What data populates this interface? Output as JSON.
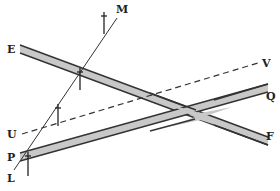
{
  "diagram": {
    "labels": {
      "M": "M",
      "E": "E",
      "V": "V",
      "U": "U",
      "Q": "Q",
      "P": "P",
      "F": "F",
      "L": "L"
    },
    "colors": {
      "band_fill": "#c8c8c8",
      "band_stroke": "#333333",
      "line": "#333333",
      "background": "#ffffff"
    },
    "elements": [
      {
        "type": "band",
        "from": "E",
        "to": "F"
      },
      {
        "type": "band",
        "from": "P",
        "to": "Q"
      },
      {
        "type": "dashed-line",
        "from": "U",
        "to": "V"
      },
      {
        "type": "thin-line",
        "from": "L",
        "to": "M"
      }
    ],
    "tick_marks": 4
  }
}
